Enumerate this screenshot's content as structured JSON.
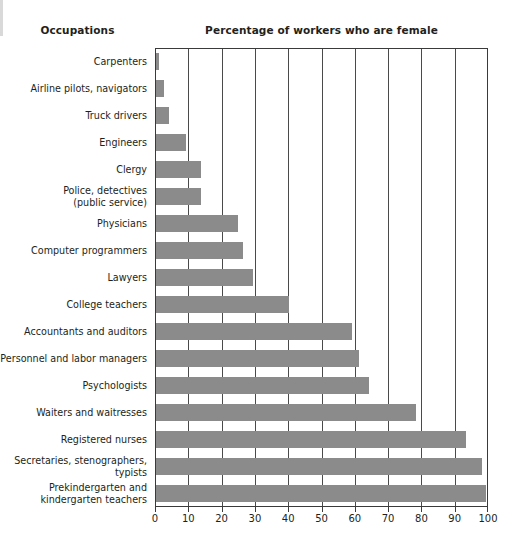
{
  "headers": {
    "category_header": "Occupations",
    "value_header": "Percentage of workers who are female"
  },
  "colors": {
    "bar": "#8b8b8b",
    "frame": "#3a3a3a",
    "gridline": "#4a4a4a",
    "text": "#231f20",
    "background": "#ffffff"
  },
  "chart_data": {
    "type": "bar",
    "orientation": "horizontal",
    "title": "Percentage of workers who are female",
    "xlabel": "",
    "ylabel": "Occupations",
    "xlim": [
      0,
      100
    ],
    "xticks": [
      0,
      10,
      20,
      30,
      40,
      50,
      60,
      70,
      80,
      90,
      100
    ],
    "grid": true,
    "legend": null,
    "categories": [
      "Carpenters",
      "Airline pilots, navigators",
      "Truck drivers",
      "Engineers",
      "Clergy",
      "Police, detectives (public service)",
      "Physicians",
      "Computer programmers",
      "Lawyers",
      "College teachers",
      "Accountants and auditors",
      "Personnel and labor managers",
      "Psychologists",
      "Waiters and waitresses",
      "Registered nurses",
      "Secretaries, stenographers, typists",
      "Prekindergarten and kindergarten teachers"
    ],
    "values": [
      1,
      2.5,
      4,
      9,
      13.5,
      13.5,
      24.5,
      26,
      29,
      40,
      59,
      61,
      64,
      78,
      93,
      98,
      99
    ]
  },
  "rows": [
    {
      "label_lines": [
        "Carpenters"
      ],
      "value": 1
    },
    {
      "label_lines": [
        "Airline pilots, navigators"
      ],
      "value": 2.5
    },
    {
      "label_lines": [
        "Truck drivers"
      ],
      "value": 4
    },
    {
      "label_lines": [
        "Engineers"
      ],
      "value": 9
    },
    {
      "label_lines": [
        "Clergy"
      ],
      "value": 13.5
    },
    {
      "label_lines": [
        "Police, detectives",
        "(public service)"
      ],
      "value": 13.5
    },
    {
      "label_lines": [
        "Physicians"
      ],
      "value": 24.5
    },
    {
      "label_lines": [
        "Computer programmers"
      ],
      "value": 26
    },
    {
      "label_lines": [
        "Lawyers"
      ],
      "value": 29
    },
    {
      "label_lines": [
        "College teachers"
      ],
      "value": 40
    },
    {
      "label_lines": [
        "Accountants and auditors"
      ],
      "value": 59
    },
    {
      "label_lines": [
        "Personnel and labor managers"
      ],
      "value": 61
    },
    {
      "label_lines": [
        "Psychologists"
      ],
      "value": 64
    },
    {
      "label_lines": [
        "Waiters and waitresses"
      ],
      "value": 78
    },
    {
      "label_lines": [
        "Registered nurses"
      ],
      "value": 93
    },
    {
      "label_lines": [
        "Secretaries, stenographers,",
        "typists"
      ],
      "value": 98
    },
    {
      "label_lines": [
        "Prekindergarten and",
        "kindergarten teachers"
      ],
      "value": 99
    }
  ],
  "axis": {
    "tick_labels": [
      "0",
      "10",
      "20",
      "30",
      "40",
      "50",
      "60",
      "70",
      "80",
      "90",
      "100"
    ]
  }
}
